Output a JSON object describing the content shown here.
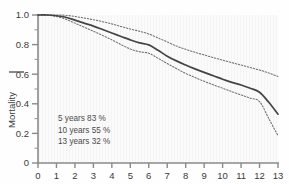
{
  "chart_data": {
    "type": "line",
    "title": "",
    "xlabel": "",
    "ylabel": "Mortality",
    "xlim": [
      0,
      13
    ],
    "ylim": [
      0,
      1.0
    ],
    "grid": false,
    "legend_position": "none",
    "x_ticks": [
      "0",
      "1",
      "2",
      "3",
      "4",
      "5",
      "6",
      "7",
      "8",
      "9",
      "10",
      "11",
      "12",
      "13"
    ],
    "x_tick_values": [
      0,
      1,
      2,
      3,
      4,
      5,
      6,
      7,
      8,
      9,
      10,
      11,
      12,
      13
    ],
    "y_ticks": [
      "1.0",
      "0.8",
      "0.6",
      "0.4",
      "0.2",
      "0"
    ],
    "y_tick_values": [
      1.0,
      0.8,
      0.6,
      0.4,
      0.2,
      0
    ],
    "y_minor_tick_values": [
      0.9,
      0.7,
      0.5,
      0.3,
      0.1
    ],
    "x": [
      0,
      0.5,
      1,
      1.5,
      2,
      2.5,
      3,
      3.5,
      4,
      4.5,
      5,
      5.5,
      6,
      6.5,
      7,
      7.5,
      8,
      8.5,
      9,
      9.5,
      10,
      10.5,
      11,
      11.5,
      12,
      12.5,
      13
    ],
    "series": [
      {
        "name": "Survival estimate",
        "style": "solid",
        "color": "#444444",
        "values": [
          1.0,
          1.0,
          0.995,
          0.985,
          0.965,
          0.945,
          0.925,
          0.902,
          0.878,
          0.855,
          0.832,
          0.812,
          0.798,
          0.762,
          0.722,
          0.69,
          0.662,
          0.636,
          0.612,
          0.59,
          0.566,
          0.545,
          0.527,
          0.505,
          0.478,
          0.41,
          0.33
        ]
      },
      {
        "name": "Upper confidence limit",
        "style": "dotted",
        "color": "#6e6e6e",
        "values": [
          1.0,
          1.0,
          1.0,
          0.998,
          0.99,
          0.98,
          0.968,
          0.955,
          0.94,
          0.922,
          0.905,
          0.89,
          0.872,
          0.845,
          0.818,
          0.79,
          0.768,
          0.748,
          0.73,
          0.712,
          0.695,
          0.678,
          0.662,
          0.645,
          0.628,
          0.608,
          0.585
        ]
      },
      {
        "name": "Lower confidence limit",
        "style": "dotted",
        "color": "#6e6e6e",
        "values": [
          1.0,
          0.998,
          0.99,
          0.972,
          0.945,
          0.918,
          0.89,
          0.862,
          0.832,
          0.8,
          0.77,
          0.752,
          0.742,
          0.708,
          0.672,
          0.638,
          0.605,
          0.578,
          0.552,
          0.528,
          0.505,
          0.482,
          0.46,
          0.438,
          0.415,
          0.3,
          0.185
        ]
      }
    ],
    "annotations": [
      {
        "label": "5 years",
        "value": "83 %",
        "text": "5 years  83 %"
      },
      {
        "label": "10 years",
        "value": "55 %",
        "text": "10 years  55 %"
      },
      {
        "label": "13 years",
        "value": "32 %",
        "text": "13 years  32 %"
      }
    ],
    "axis_color": "#808080",
    "plot_background": "#fbfbfb"
  }
}
